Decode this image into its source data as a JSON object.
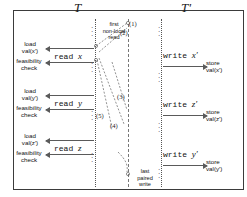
{
  "figure": {
    "type": "sequence-diagram",
    "columns": {
      "left_title": "T",
      "right_title": "T'"
    },
    "left_steps": [
      {
        "load_line1": "load",
        "load_line2": "val(x′)",
        "feas_line1": "feasibility",
        "feas_line2": "check",
        "op": "read",
        "var": "x"
      },
      {
        "load_line1": "load",
        "load_line2": "val(y′)",
        "feas_line1": "feasibility",
        "feas_line2": "check",
        "op": "read",
        "var": "y"
      },
      {
        "load_line1": "load",
        "load_line2": "val(z′)",
        "feas_line1": "feasibility",
        "feas_line2": "check",
        "op": "read",
        "var": "z"
      }
    ],
    "right_steps": [
      {
        "op": "write",
        "var": "x′",
        "store_line1": "store",
        "store_line2": "val(x′)"
      },
      {
        "op": "write",
        "var": "z′",
        "store_line1": "store",
        "store_line2": "val(z′)"
      },
      {
        "op": "write",
        "var": "y′",
        "store_line1": "store",
        "store_line2": "val(y′)"
      }
    ],
    "annotations": {
      "first_read": "first\nnon-local\nread",
      "first_read_l1": "first",
      "first_read_l2": "non-local",
      "first_read_l3": "read",
      "last_write_l1": "last",
      "last_write_l2": "paired",
      "last_write_l3": "write"
    },
    "edge_labels": [
      "(1)",
      "(2)",
      "(3)",
      "(4)",
      "(5)"
    ],
    "ellipsis": "⋮",
    "colors": {
      "border": "#3b3b3b",
      "arrow": "#5a5a5a",
      "text": "#111111",
      "timeline": "#555555"
    }
  }
}
